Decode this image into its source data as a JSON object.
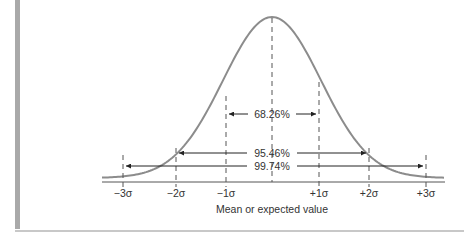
{
  "chart_data": {
    "type": "line",
    "title": "",
    "xlabel": "Mean or expected value",
    "ylabel": "",
    "x_tick_labels": [
      "−3σ",
      "−2σ",
      "−1σ",
      "+1σ",
      "+2σ",
      "+3σ"
    ],
    "x_ticks_sigma": [
      -3,
      -2,
      -1,
      0,
      1,
      2,
      3
    ],
    "intervals": [
      {
        "label": "68.26%",
        "from_sigma": -1,
        "to_sigma": 1
      },
      {
        "label": "95.46%",
        "from_sigma": -2,
        "to_sigma": 2
      },
      {
        "label": "99.74%",
        "from_sigma": -3,
        "to_sigma": 3
      }
    ],
    "curve_color": "#8c8c8c",
    "grid": false,
    "legend": "none"
  },
  "labels": {
    "ticks": [
      "−3σ",
      "−2σ",
      "−1σ",
      "+1σ",
      "+2σ",
      "+3σ"
    ],
    "interval_1": "68.26%",
    "interval_2": "95.46%",
    "interval_3": "99.74%",
    "x_axis_title": "Mean or expected value"
  }
}
